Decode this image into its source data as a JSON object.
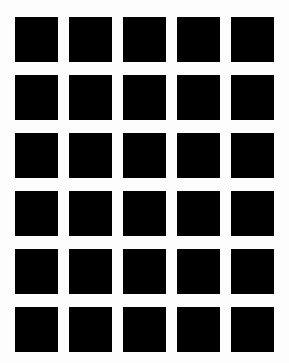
{
  "image": {
    "background_color": "#fdfdfd",
    "square_color": "#000000"
  },
  "grid": {
    "columns": 5,
    "rows": 6,
    "cells": [
      [
        1,
        1,
        1,
        1,
        1
      ],
      [
        1,
        1,
        1,
        1,
        1
      ],
      [
        1,
        1,
        1,
        1,
        1
      ],
      [
        1,
        1,
        1,
        1,
        1
      ],
      [
        1,
        1,
        1,
        1,
        1
      ],
      [
        1,
        1,
        1,
        1,
        1
      ]
    ]
  }
}
